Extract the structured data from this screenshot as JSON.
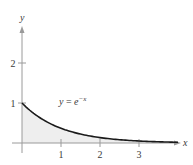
{
  "chart_data": {
    "type": "area",
    "title": "",
    "function_label": "y = e^{-x}",
    "function_label_parts": {
      "lhs": "y",
      "eq": " = ",
      "base": "e",
      "exp": "−x"
    },
    "xlabel": "x",
    "ylabel": "y",
    "xlim": [
      -0.1,
      4.1
    ],
    "ylim": [
      -0.25,
      2.9
    ],
    "x_ticks": [
      1,
      2,
      3
    ],
    "x_tick_labels": [
      "1",
      "2",
      "3"
    ],
    "y_ticks": [
      1,
      2
    ],
    "y_tick_labels": [
      "1",
      "2"
    ],
    "grid": false,
    "shaded_region": {
      "from_x": 0,
      "to_x": 4,
      "below": "curve",
      "color": "#eeeeee"
    },
    "x": [
      0,
      0.5,
      1,
      1.5,
      2,
      2.5,
      3,
      3.5,
      4
    ],
    "values": [
      1.0,
      0.607,
      0.368,
      0.223,
      0.135,
      0.082,
      0.05,
      0.03,
      0.018
    ],
    "colors": {
      "curve": "#1a1a1a",
      "axis": "#9a9a9a",
      "fill": "#eeeeee",
      "text": "#3a3a3a"
    }
  }
}
